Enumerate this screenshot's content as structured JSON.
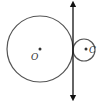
{
  "diagram": {
    "type": "geometry",
    "stroke_color": "#555555",
    "line_color": "#111111",
    "circles": [
      {
        "id": "large",
        "center_label": "O",
        "cx": 40,
        "cy": 49,
        "r": 33
      },
      {
        "id": "small",
        "center_label": "C",
        "cx": 84,
        "cy": 50,
        "r": 11
      }
    ],
    "tangent_line": {
      "x": 73,
      "y1": 2,
      "y2": 100,
      "arrows": "both"
    }
  }
}
